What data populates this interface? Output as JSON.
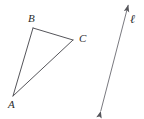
{
  "figure": {
    "background_color": "#ffffff",
    "stroke_color": "#55555a",
    "label_color": "#2b2b2b",
    "width": 144,
    "height": 119
  },
  "triangle": {
    "name": "triangle-ABC",
    "vertices": [
      {
        "label": "A",
        "x": 13,
        "y": 96
      },
      {
        "label": "B",
        "x": 33,
        "y": 28
      },
      {
        "label": "C",
        "x": 73,
        "y": 40
      }
    ],
    "edges": [
      {
        "name": "segment-AB",
        "from": "A",
        "to": "B"
      },
      {
        "name": "segment-BC",
        "from": "B",
        "to": "C"
      },
      {
        "name": "segment-CA",
        "from": "C",
        "to": "A"
      }
    ],
    "labels": {
      "a": "A",
      "b": "B",
      "c": "C"
    }
  },
  "line": {
    "name": "line-ell",
    "label": "ℓ",
    "start": {
      "x": 100,
      "y": 114
    },
    "end": {
      "x": 129,
      "y": 2
    },
    "arrowheads": "both"
  }
}
